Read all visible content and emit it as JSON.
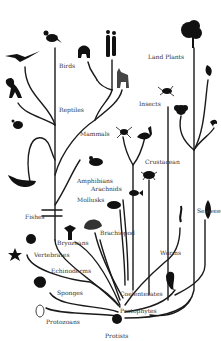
{
  "diagram": {
    "title": "",
    "root": "Protists",
    "colors": {
      "branch": "#1a1a1a",
      "silhouette": "#111111",
      "label": "#333333",
      "background": "#ffffff"
    },
    "labels": [
      {
        "id": "birds",
        "text": "Birds",
        "x": 59,
        "y": 66
      },
      {
        "id": "reptiles",
        "text": "Reptiles",
        "x": 59,
        "y": 109
      },
      {
        "id": "land-plants",
        "text": "Land Plants",
        "x": 148,
        "y": 54
      },
      {
        "id": "insects",
        "text": "Insects",
        "x": 139,
        "y": 101
      },
      {
        "id": "mammals",
        "text": "Mammals",
        "x": 80,
        "y": 130
      },
      {
        "id": "crustacean",
        "text": "Crustacean",
        "x": 145,
        "y": 159
      },
      {
        "id": "amphibians",
        "text": "Amphibians",
        "x": 77,
        "y": 178
      },
      {
        "id": "arachnids",
        "text": "Arachnids",
        "x": 91,
        "y": 186
      },
      {
        "id": "mollusks",
        "text": "Mollusks",
        "x": 77,
        "y": 197
      },
      {
        "id": "fishes",
        "text": "Fishes",
        "x": 25,
        "y": 214
      },
      {
        "id": "seaweed",
        "text": "Seaweed",
        "x": 197,
        "y": 208
      },
      {
        "id": "brachiopod",
        "text": "Brachiopod",
        "x": 100,
        "y": 230
      },
      {
        "id": "bryozoans",
        "text": "Bryozoans",
        "x": 57,
        "y": 240
      },
      {
        "id": "vertebrates",
        "text": "Vertebrates",
        "x": 34,
        "y": 252
      },
      {
        "id": "worms",
        "text": "Worms",
        "x": 160,
        "y": 251
      },
      {
        "id": "echinoderms",
        "text": "Echinoderms",
        "x": 51,
        "y": 268
      },
      {
        "id": "sponges",
        "text": "Sponges",
        "x": 57,
        "y": 292
      },
      {
        "id": "coelenterates",
        "text": "Coelenterates",
        "x": 120,
        "y": 292
      },
      {
        "id": "protophytes",
        "text": "Protophytes",
        "x": 120,
        "y": 309
      },
      {
        "id": "protozoans",
        "text": "Protozoans",
        "x": 46,
        "y": 321
      },
      {
        "id": "protists",
        "text": "Protists",
        "x": 105,
        "y": 334
      }
    ],
    "organisms": [
      "crow",
      "pterosaur",
      "dinosaur",
      "turtle",
      "whale",
      "gorilla",
      "humans",
      "zebra",
      "frog",
      "spider",
      "scorpion",
      "crab",
      "fish",
      "squid",
      "scallop-shell",
      "bryozoan",
      "sea-urchin",
      "starfish",
      "sponge",
      "protozoan",
      "tree",
      "fern",
      "flower",
      "beetle",
      "seaweed-frond",
      "worm",
      "jellyfish",
      "cell",
      "coral"
    ]
  }
}
